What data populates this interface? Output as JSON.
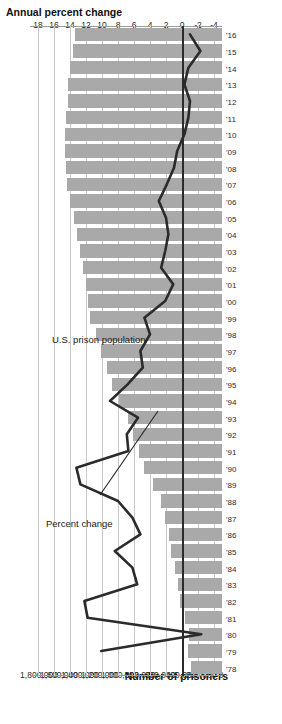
{
  "chart_data": {
    "type": "bar",
    "title": "",
    "orientation": "horizontal-rotated",
    "xlabel": "",
    "categories": [
      "'78",
      "'79",
      "'80",
      "'81",
      "'82",
      "'83",
      "'84",
      "'85",
      "'86",
      "'87",
      "'88",
      "'89",
      "'90",
      "'91",
      "'92",
      "'93",
      "'94",
      "'95",
      "'96",
      "'97",
      "'98",
      "'99",
      "'00",
      "'01",
      "'02",
      "'03",
      "'04",
      "'05",
      "'06",
      "'07",
      "'08",
      "'09",
      "'10",
      "'11",
      "'12",
      "'13",
      "'14",
      "'15",
      "'16"
    ],
    "series": [
      {
        "name": "U.S. prison population",
        "type": "bar",
        "axis": "prisoners",
        "ylabel": "Number of prisoners",
        "ylim": [
          0,
          1900000
        ],
        "ticks": [
          1800000,
          1600000,
          1400000,
          1200000,
          1000000,
          800000,
          600000,
          400000,
          200000,
          0
        ],
        "tick_labels": [
          "1,800,000",
          "1,600,000",
          "1,400,000",
          "1,200,000",
          "1,000,000",
          "800,000",
          "600,000",
          "400,000",
          "200,000",
          "0"
        ],
        "values": [
          307000,
          338000,
          330000,
          369000,
          414000,
          437000,
          464000,
          503000,
          529000,
          562000,
          607000,
          684000,
          774000,
          826000,
          883000,
          932000,
          1016000,
          1085000,
          1138000,
          1197000,
          1245000,
          1304000,
          1331000,
          1345000,
          1380000,
          1409000,
          1433000,
          1462000,
          1504000,
          1532000,
          1547000,
          1556000,
          1552000,
          1540000,
          1524000,
          1520000,
          1508000,
          1474000,
          1459000
        ]
      },
      {
        "name": "Percent change",
        "type": "line",
        "axis": "percent",
        "ylabel": "Annual percent change",
        "ylim": [
          -5,
          19
        ],
        "ticks": [
          18,
          16,
          14,
          12,
          10,
          8,
          6,
          4,
          2,
          0,
          -2,
          -4
        ],
        "tick_labels": [
          "18",
          "16",
          "14",
          "12",
          "10",
          "8",
          "6",
          "4",
          "2",
          "0",
          "-2",
          "-4"
        ],
        "values": [
          null,
          10.1,
          -2.4,
          11.8,
          12.2,
          5.6,
          6.2,
          8.4,
          5.2,
          6.2,
          8.0,
          12.7,
          13.2,
          6.7,
          6.9,
          5.5,
          9.0,
          6.8,
          4.9,
          5.2,
          4.0,
          4.7,
          2.1,
          1.1,
          2.6,
          2.1,
          1.7,
          2.0,
          2.9,
          1.9,
          1.0,
          0.6,
          -0.3,
          -0.8,
          -1.0,
          -0.3,
          -0.8,
          -2.3,
          -1.0
        ]
      }
    ],
    "annotations": [
      {
        "text": "U.S. prison population",
        "refers_to": "bars"
      },
      {
        "text": "Percent change",
        "refers_to": "line"
      }
    ],
    "grid": true,
    "legend": "inline-annotations"
  },
  "axes": {
    "top": {
      "title": "Annual percent change"
    },
    "bottom": {
      "title": "Number of prisoners"
    }
  },
  "colors": {
    "bar": "#a9a9a9",
    "line": "#2b2b2b",
    "grid": "#c9c9c9",
    "zero_line": "#2b2b2b",
    "text": "#1a1a1a",
    "background": "#ffffff"
  }
}
